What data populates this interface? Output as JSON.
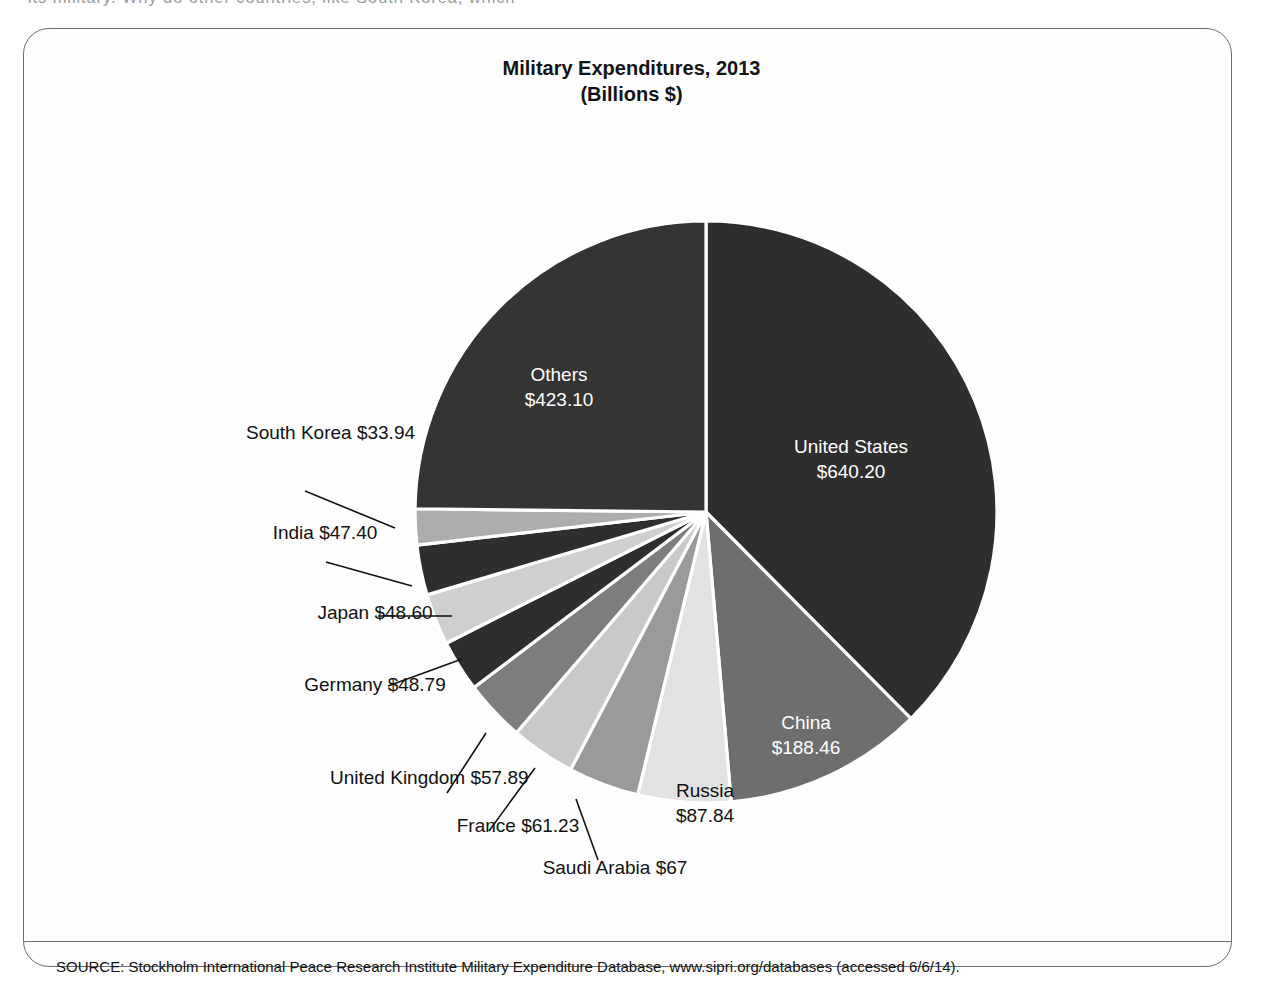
{
  "page": {
    "body_text_fragment": "its military. Why do other countries, like South Korea, which"
  },
  "figure": {
    "title": "Military Expenditures, 2013",
    "subtitle": "(Billions $)",
    "source_note": "SOURCE: Stockholm International Peace Research Institute Military Expenditure Database, www.sipri.org/databases (accessed 6/6/14)."
  },
  "labels": {
    "united_states": {
      "name": "United States",
      "value": "$640.20"
    },
    "others": {
      "name": "Others",
      "value": "$423.10"
    },
    "china": {
      "name": "China",
      "value": "$188.46"
    },
    "russia": {
      "name": "Russia",
      "value": "$87.84"
    },
    "saudi_arabia": {
      "name": "Saudi\nArabia",
      "name_line1": "Saudi",
      "name_line2": "Arabia",
      "value": "$67"
    },
    "france": {
      "name": "France",
      "value": "$61.23"
    },
    "united_kingdom": {
      "name_line1": "United",
      "name_line2": "Kingdom",
      "value": "$57.89"
    },
    "germany": {
      "name": "Germany",
      "value": "$48.79"
    },
    "japan": {
      "name": "Japan",
      "value": "$48.60"
    },
    "india": {
      "name": "India",
      "value": "$47.40"
    },
    "south_korea": {
      "name_line1": "South",
      "name_line2": "Korea",
      "value": "$33.94"
    }
  },
  "colors": {
    "united_states": "#2e2e2e",
    "china": "#6e6e6e",
    "russia": "#e2e2e2",
    "saudi_arabia": "#9a9a9a",
    "france": "#c9c9c9",
    "united_kingdom": "#7d7d7d",
    "germany": "#2e2e2e",
    "japan": "#cfcfcf",
    "india": "#2e2e2e",
    "south_korea": "#adadad",
    "others": "#343434",
    "slice_border": "#ffffff",
    "frame": "#6d6d6d",
    "text_dark": "#111111",
    "text_light": "#ffffff"
  },
  "chart_data": {
    "type": "pie",
    "title": "Military Expenditures, 2013",
    "subtitle": "(Billions $)",
    "unit": "Billions USD",
    "year": 2013,
    "total": 1704.45,
    "start_angle_deg": 0,
    "direction": "clockwise",
    "legend": "none (labels drawn on and around slices)",
    "labels": [
      "United States",
      "China",
      "Russia",
      "Saudi Arabia",
      "France",
      "United Kingdom",
      "Germany",
      "Japan",
      "India",
      "South Korea",
      "Others"
    ],
    "values": [
      640.2,
      188.46,
      87.84,
      67,
      61.23,
      57.89,
      48.79,
      48.6,
      47.4,
      33.94,
      423.1
    ],
    "display_values": [
      "$640.20",
      "$188.46",
      "$87.84",
      "$67",
      "$61.23",
      "$57.89",
      "$48.79",
      "$48.60",
      "$47.40",
      "$33.94",
      "$423.10"
    ],
    "colors": [
      "#2e2e2e",
      "#6e6e6e",
      "#e2e2e2",
      "#9a9a9a",
      "#c9c9c9",
      "#7d7d7d",
      "#2e2e2e",
      "#cfcfcf",
      "#2e2e2e",
      "#adadad",
      "#343434"
    ],
    "label_placement": [
      "inside",
      "inside",
      "inside",
      "outside",
      "outside",
      "outside",
      "outside",
      "outside",
      "outside",
      "outside",
      "inside"
    ],
    "source": "Stockholm International Peace Research Institute Military Expenditure Database, www.sipri.org/databases (accessed 6/6/14)."
  }
}
